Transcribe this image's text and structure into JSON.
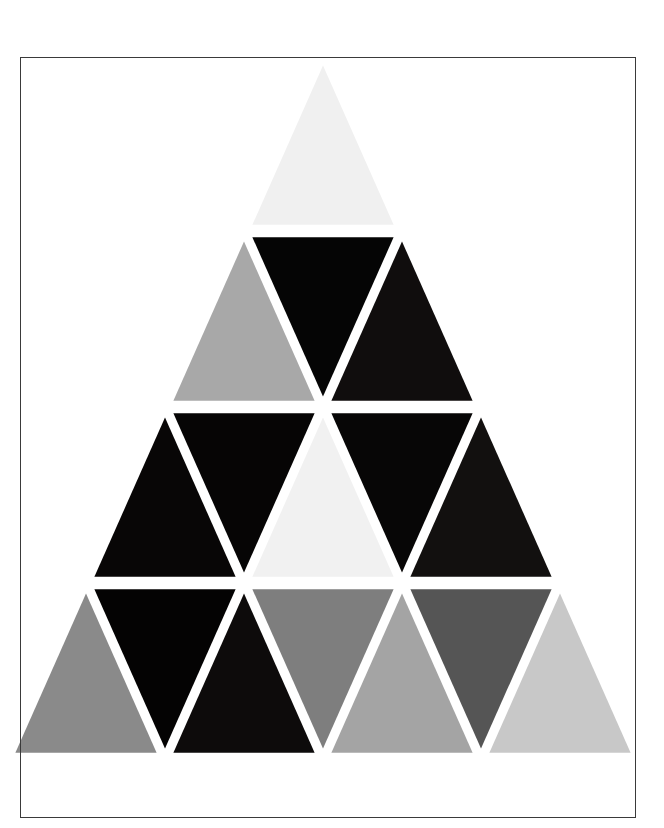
{
  "page": {
    "title": "Triangle Grid Artwork",
    "background_color": "#ffffff",
    "width": 664,
    "height": 828
  },
  "border": {
    "name": "page-border-rectangle",
    "color": "#3a3a3a",
    "thickness_px": 1,
    "left": 20,
    "top": 57,
    "width": 616,
    "height": 761
  },
  "artwork": {
    "name": "grayscale-triangle-pyramid",
    "description": "Equilateral triangle subdivided into 4 rows of alternating up and down triangles, each filled with a grayscale tone, separated by white gaps.",
    "gap_color": "#ffffff",
    "apex_x": 323,
    "apex_y": 55,
    "row_height": 176,
    "half_width": 316,
    "clip_bottom_y": 758,
    "rows": [
      {
        "row_index": 1,
        "count": 1,
        "triangles": [
          {
            "id": "r1-t1",
            "orientation": "up",
            "color": "#f0f0f0",
            "tone": "near-white"
          }
        ]
      },
      {
        "row_index": 2,
        "count": 3,
        "triangles": [
          {
            "id": "r2-t1",
            "orientation": "up",
            "color": "#a8a8a8",
            "tone": "mid-gray"
          },
          {
            "id": "r2-t2",
            "orientation": "down",
            "color": "#050505",
            "tone": "black"
          },
          {
            "id": "r2-t3",
            "orientation": "up",
            "color": "#100d0d",
            "tone": "near-black"
          }
        ]
      },
      {
        "row_index": 3,
        "count": 5,
        "triangles": [
          {
            "id": "r3-t1",
            "orientation": "up",
            "color": "#080606",
            "tone": "black"
          },
          {
            "id": "r3-t2",
            "orientation": "down",
            "color": "#060505",
            "tone": "black"
          },
          {
            "id": "r3-t3",
            "orientation": "up",
            "color": "#f1f1f1",
            "tone": "near-white"
          },
          {
            "id": "r3-t4",
            "orientation": "down",
            "color": "#070606",
            "tone": "black"
          },
          {
            "id": "r3-t5",
            "orientation": "up",
            "color": "#12100f",
            "tone": "near-black"
          }
        ]
      },
      {
        "row_index": 4,
        "count": 7,
        "triangles": [
          {
            "id": "r4-t1",
            "orientation": "up",
            "color": "#8a8a8a",
            "tone": "mid-gray"
          },
          {
            "id": "r4-t2",
            "orientation": "down",
            "color": "#040303",
            "tone": "black"
          },
          {
            "id": "r4-t3",
            "orientation": "up",
            "color": "#0d0b0b",
            "tone": "near-black"
          },
          {
            "id": "r4-t4",
            "orientation": "down",
            "color": "#7e7e7e",
            "tone": "mid-dark-gray"
          },
          {
            "id": "r4-t5",
            "orientation": "up",
            "color": "#a4a4a4",
            "tone": "light-mid-gray"
          },
          {
            "id": "r4-t6",
            "orientation": "down",
            "color": "#555555",
            "tone": "dark-gray"
          },
          {
            "id": "r4-t7",
            "orientation": "up",
            "color": "#c8c8c8",
            "tone": "light-gray"
          }
        ]
      }
    ]
  }
}
